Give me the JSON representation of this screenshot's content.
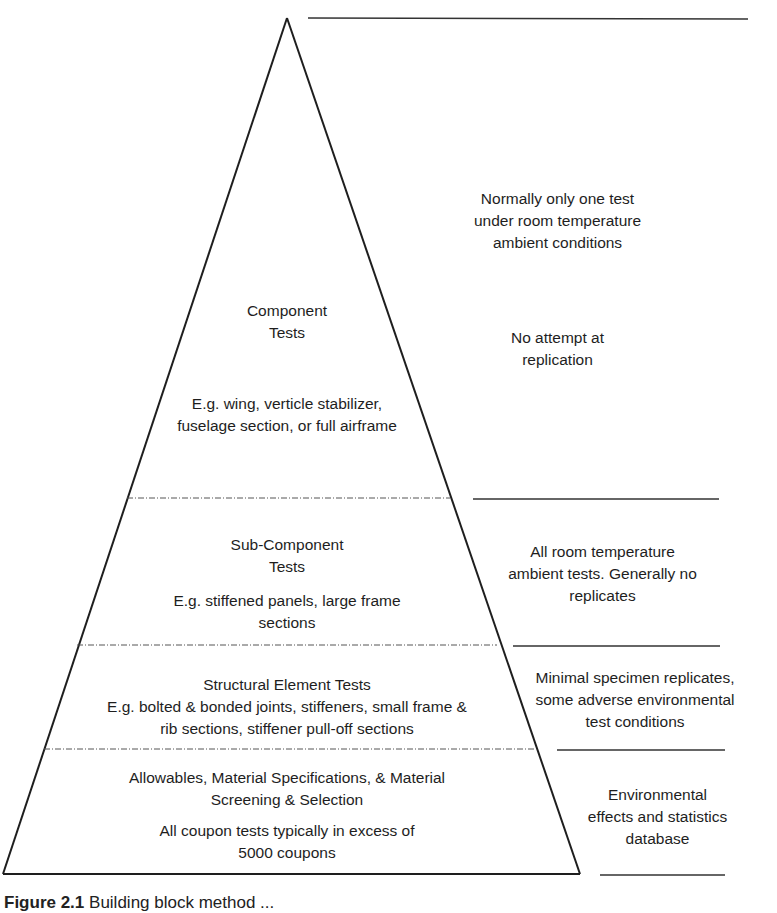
{
  "diagram": {
    "type": "pyramid",
    "tiers": [
      {
        "name": "Component Tests",
        "title_lines": [
          "Component",
          "Tests"
        ],
        "detail_lines": [
          "E.g. wing, verticle stabilizer,",
          "fuselage section, or full airframe"
        ],
        "note_lines_top": [
          "Normally only one test",
          "under room temperature",
          "ambient conditions"
        ],
        "note_lines": [
          "No attempt at",
          "replication"
        ]
      },
      {
        "name": "Sub-Component Tests",
        "title_lines": [
          "Sub-Component",
          "Tests"
        ],
        "detail_lines": [
          "E.g. stiffened panels, large frame",
          "sections"
        ],
        "note_lines": [
          "All room temperature",
          "ambient tests. Generally no",
          "replicates"
        ]
      },
      {
        "name": "Structural Element Tests",
        "title_lines": [
          "Structural Element Tests"
        ],
        "detail_lines": [
          "E.g. bolted & bonded joints, stiffeners, small frame &",
          "rib sections, stiffener pull-off sections"
        ],
        "note_lines": [
          "Minimal specimen replicates,",
          "some adverse environmental",
          "test conditions"
        ]
      },
      {
        "name": "Allowables / Coupon Tests",
        "title_lines": [
          "Allowables, Material Specifications, & Material",
          "Screening & Selection"
        ],
        "detail_lines": [
          "All coupon tests typically in excess of",
          "5000 coupons"
        ],
        "note_lines": [
          "Environmental",
          "effects and statistics",
          "database"
        ]
      }
    ],
    "caption": {
      "label": "Figure 2.1",
      "text": "Building block method ..."
    },
    "colors": {
      "line": "#1e1e1e",
      "dash": "#555555",
      "background": "#ffffff"
    }
  }
}
